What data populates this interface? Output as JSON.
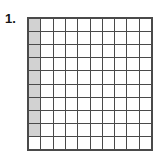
{
  "problem": {
    "number_label": "1."
  },
  "figure": {
    "type": "hundred-square-grid",
    "rows": 10,
    "columns": 10,
    "total_cells": 100,
    "shaded_count": 9,
    "unshaded_count": 91,
    "shaded_description": "first column, top nine cells",
    "colors": {
      "shaded_fill": "#d2d2d2",
      "unshaded_fill": "#ffffff",
      "grid_line": "#4a4a4a",
      "label_text": "#161616",
      "background": "#ffffff"
    },
    "cells": [
      [
        1,
        0,
        0,
        0,
        0,
        0,
        0,
        0,
        0,
        0
      ],
      [
        1,
        0,
        0,
        0,
        0,
        0,
        0,
        0,
        0,
        0
      ],
      [
        1,
        0,
        0,
        0,
        0,
        0,
        0,
        0,
        0,
        0
      ],
      [
        1,
        0,
        0,
        0,
        0,
        0,
        0,
        0,
        0,
        0
      ],
      [
        1,
        0,
        0,
        0,
        0,
        0,
        0,
        0,
        0,
        0
      ],
      [
        1,
        0,
        0,
        0,
        0,
        0,
        0,
        0,
        0,
        0
      ],
      [
        1,
        0,
        0,
        0,
        0,
        0,
        0,
        0,
        0,
        0
      ],
      [
        1,
        0,
        0,
        0,
        0,
        0,
        0,
        0,
        0,
        0
      ],
      [
        1,
        0,
        0,
        0,
        0,
        0,
        0,
        0,
        0,
        0
      ],
      [
        0,
        0,
        0,
        0,
        0,
        0,
        0,
        0,
        0,
        0
      ]
    ]
  }
}
